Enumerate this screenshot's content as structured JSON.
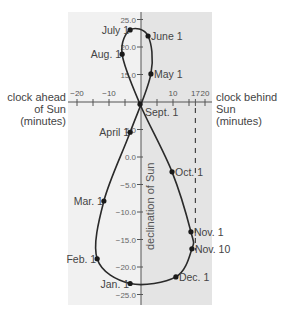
{
  "chart_data": {
    "type": "scatter",
    "subtype": "analemma (closed curve through dated points)",
    "title": "",
    "xlabel_left": "clock ahead of Sun (minutes)",
    "xlabel_right": "clock behind Sun (minutes)",
    "ylabel": "declination of Sun",
    "xlim": [
      -22,
      22
    ],
    "ylim": [
      -26,
      26
    ],
    "x_axis_crosses_y_at": 10.0,
    "x_ticks": [
      -20,
      -15,
      -10,
      -5,
      0,
      5,
      10,
      15,
      17,
      20
    ],
    "x_tick_labels": [
      {
        "value": -20,
        "label": "−20"
      },
      {
        "value": -10,
        "label": "−10"
      },
      {
        "value": 10,
        "label": "10"
      },
      {
        "value": 17,
        "label": "17"
      },
      {
        "value": 20,
        "label": "20"
      }
    ],
    "y_tick_labels": [
      {
        "value": 25.0,
        "label": "25.0"
      },
      {
        "value": 20.0,
        "label": "20.0"
      },
      {
        "value": 15.0,
        "label": "15.0"
      },
      {
        "value": 5.0,
        "label": "5.0"
      },
      {
        "value": 0.0,
        "label": "0.0"
      },
      {
        "value": -5.0,
        "label": "−5.0"
      },
      {
        "value": -10.0,
        "label": "−10.0"
      },
      {
        "value": -15.0,
        "label": "−15.0"
      },
      {
        "value": -20.0,
        "label": "−20.0"
      },
      {
        "value": -25.0,
        "label": "−25.0"
      }
    ],
    "points": [
      {
        "label": "Jan. 1",
        "x": -3.4,
        "y": -23.0,
        "label_side": "left"
      },
      {
        "label": "Feb. 1",
        "x": -13.7,
        "y": -18.5,
        "label_side": "left"
      },
      {
        "label": "Mar. 1",
        "x": -11.6,
        "y": -8.0,
        "label_side": "left"
      },
      {
        "label": "April 1",
        "x": -3.4,
        "y": 4.5,
        "label_side": "left"
      },
      {
        "label": "May 1",
        "x": 3.1,
        "y": 15.1,
        "label_side": "right"
      },
      {
        "label": "June 1",
        "x": 2.2,
        "y": 22.0,
        "label_side": "right"
      },
      {
        "label": "July 1",
        "x": -3.4,
        "y": 23.1,
        "label_side": "left"
      },
      {
        "label": "Aug. 1",
        "x": -5.9,
        "y": 18.7,
        "label_side": "left"
      },
      {
        "label": "Sept. 1",
        "x": -0.3,
        "y": 9.6,
        "label_side": "right-below"
      },
      {
        "label": "Oct. 1",
        "x": 9.7,
        "y": -2.7,
        "label_side": "right"
      },
      {
        "label": "Nov. 1",
        "x": 15.6,
        "y": -13.6,
        "label_side": "right"
      },
      {
        "label": "Nov. 10",
        "x": 15.9,
        "y": -16.7,
        "label_side": "right"
      },
      {
        "label": "Dec. 1",
        "x": 10.9,
        "y": -21.8,
        "label_side": "right"
      }
    ],
    "annotations": [
      {
        "type": "dashed-vertical-line",
        "x": 17,
        "y_from": 10.0,
        "y_to": -17.0
      }
    ],
    "grid": false,
    "legend": null
  },
  "labels": {
    "left_side": [
      "clock ahead",
      "of Sun",
      "(minutes)"
    ],
    "right_side": [
      "clock behind",
      "Sun",
      "(minutes)"
    ],
    "y_axis_title": "declination of Sun"
  },
  "colors": {
    "panel_left": "#f1f1f1",
    "panel_right": "#e4e4e4",
    "curve": "#2a2a2a",
    "axis": "#555555",
    "text": "#444444"
  }
}
